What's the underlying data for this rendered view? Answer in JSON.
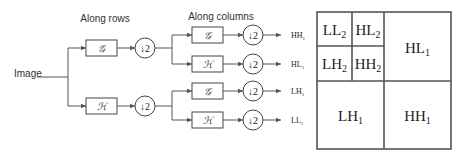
{
  "diagram": {
    "input_label": "Image",
    "stage1_title": "Along rows",
    "stage2_title": "Along columns",
    "filter_g": "𝒢",
    "filter_h": "ℋ",
    "downsample": "↓2",
    "outputs": [
      "HH",
      "HL",
      "LH",
      "LL"
    ],
    "output_subscript": "1"
  },
  "subbands": {
    "ll2": {
      "main": "LL",
      "sub": "2"
    },
    "hl2": {
      "main": "HL",
      "sub": "2"
    },
    "lh2": {
      "main": "LH",
      "sub": "2"
    },
    "hh2": {
      "main": "HH",
      "sub": "2"
    },
    "hl1": {
      "main": "HL",
      "sub": "1"
    },
    "lh1": {
      "main": "LH",
      "sub": "1"
    },
    "hh1": {
      "main": "HH",
      "sub": "1"
    }
  },
  "colors": {
    "line": "#555555",
    "text": "#333333",
    "background": "#ffffff"
  }
}
